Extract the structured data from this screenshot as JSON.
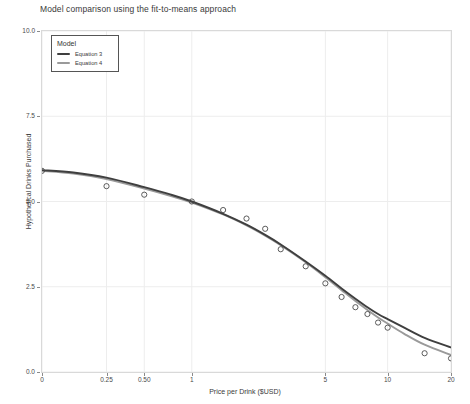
{
  "chart_data": {
    "type": "line",
    "title": "Model comparison using the fit-to-means approach",
    "xlabel": "Price per Drink ($USD)",
    "ylabel": "Hypothetical Drinks Purchased",
    "x_scale": "log-plus-one",
    "xticks": [
      0,
      0.25,
      0.5,
      1,
      5,
      10,
      20
    ],
    "xticklabels": [
      "0",
      "0.25",
      "0.50",
      "1",
      "5",
      "10",
      "20"
    ],
    "xlim": [
      0,
      20
    ],
    "yticks": [
      0.0,
      2.5,
      5.0,
      7.5,
      10.0
    ],
    "yticklabels": [
      "0.0",
      "2.5",
      "5.0",
      "7.5",
      "10.0"
    ],
    "ylim": [
      0,
      10
    ],
    "grid": true,
    "legend_position": "top-left",
    "legend_title": "Model",
    "points": {
      "name": "Observed means",
      "marker": "open-circle",
      "x": [
        0,
        0.25,
        0.5,
        1,
        1.5,
        2,
        2.5,
        3,
        4,
        5,
        6,
        7,
        8,
        9,
        10,
        15,
        20
      ],
      "y": [
        5.9,
        5.45,
        5.2,
        5.0,
        4.75,
        4.5,
        4.2,
        3.6,
        3.1,
        2.6,
        2.2,
        1.9,
        1.7,
        1.45,
        1.3,
        0.55,
        0.4
      ]
    },
    "series": [
      {
        "name": "Equation 3",
        "color": "#3f3f3f",
        "x": [
          0,
          0.1,
          0.25,
          0.5,
          0.75,
          1,
          1.5,
          2,
          2.5,
          3,
          4,
          5,
          6,
          7,
          8,
          9,
          10,
          12,
          15,
          20
        ],
        "y": [
          5.92,
          5.85,
          5.7,
          5.42,
          5.2,
          5.0,
          4.64,
          4.32,
          4.02,
          3.74,
          3.24,
          2.82,
          2.45,
          2.15,
          1.9,
          1.7,
          1.55,
          1.3,
          1.0,
          0.72
        ]
      },
      {
        "name": "Equation 4",
        "color": "#9a9a9a",
        "x": [
          0,
          0.1,
          0.25,
          0.5,
          0.75,
          1,
          1.5,
          2,
          2.5,
          3,
          4,
          5,
          6,
          7,
          8,
          9,
          10,
          12,
          15,
          20
        ],
        "y": [
          5.9,
          5.82,
          5.66,
          5.38,
          5.16,
          4.97,
          4.62,
          4.3,
          4.0,
          3.72,
          3.22,
          2.78,
          2.4,
          2.08,
          1.82,
          1.6,
          1.42,
          1.12,
          0.8,
          0.5
        ]
      }
    ]
  },
  "legend": {
    "title": "Model",
    "entries": [
      {
        "label": "Equation 3",
        "color": "#3f3f3f"
      },
      {
        "label": "Equation 4",
        "color": "#9a9a9a"
      }
    ]
  },
  "colors": {
    "equation3": "#3f3f3f",
    "equation4": "#9a9a9a",
    "grid": "#ededed",
    "panel_border": "#d9d9d9",
    "text": "#3a3a3a"
  }
}
